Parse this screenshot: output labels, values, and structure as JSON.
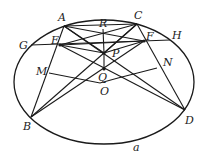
{
  "diagram": {
    "stroke_color": "#1a1a1a",
    "ellipse": {
      "cx": 104,
      "cy": 82,
      "rx": 90,
      "ry": 62,
      "label": "a",
      "label_x": 133,
      "label_y": 151
    },
    "points": {
      "A": {
        "x": 64,
        "y": 26,
        "label": "A",
        "lx": 58,
        "ly": 21
      },
      "C": {
        "x": 137,
        "y": 24,
        "label": "C",
        "lx": 134,
        "ly": 19
      },
      "R": {
        "x": 103,
        "y": 29,
        "label": "R",
        "lx": 99,
        "ly": 27
      },
      "G": {
        "x": 31,
        "y": 45,
        "label": "G",
        "lx": 19,
        "ly": 49
      },
      "E": {
        "x": 60,
        "y": 45,
        "label": "E",
        "lx": 51,
        "ly": 44
      },
      "F": {
        "x": 144,
        "y": 41,
        "label": "F",
        "lx": 146,
        "ly": 40
      },
      "H": {
        "x": 170,
        "y": 40,
        "label": "H",
        "lx": 172,
        "ly": 39
      },
      "P": {
        "x": 104,
        "y": 53,
        "label": "P",
        "lx": 112,
        "ly": 57
      },
      "Q": {
        "x": 104,
        "y": 69,
        "label": "Q",
        "lx": 98,
        "ly": 81
      },
      "O": {
        "x": 105,
        "y": 82,
        "label": "O",
        "lx": 100,
        "ly": 95
      },
      "M": {
        "x": 49,
        "y": 73,
        "label": "M",
        "lx": 36,
        "ly": 75
      },
      "N": {
        "x": 157,
        "y": 68,
        "label": "N",
        "lx": 163,
        "ly": 66
      },
      "B": {
        "x": 31,
        "y": 117,
        "label": "B",
        "lx": 23,
        "ly": 130
      },
      "D": {
        "x": 185,
        "y": 110,
        "label": "D",
        "lx": 185,
        "ly": 124
      }
    },
    "segments": [
      [
        "G",
        "H"
      ],
      [
        "A",
        "C"
      ],
      [
        "A",
        "B"
      ],
      [
        "C",
        "D"
      ],
      [
        "A",
        "D"
      ],
      [
        "C",
        "B"
      ],
      [
        "E",
        "D"
      ],
      [
        "F",
        "B"
      ],
      [
        "E",
        "C"
      ],
      [
        "A",
        "F"
      ],
      [
        "E",
        "F"
      ],
      [
        "R",
        "P"
      ],
      [
        "P",
        "Q"
      ],
      [
        "E",
        "P"
      ],
      [
        "F",
        "P"
      ],
      [
        "A",
        "P"
      ],
      [
        "C",
        "P"
      ]
    ],
    "polyline_MN": [
      [
        49,
        73
      ],
      [
        100,
        83
      ],
      [
        118,
        78
      ],
      [
        157,
        68
      ]
    ]
  }
}
